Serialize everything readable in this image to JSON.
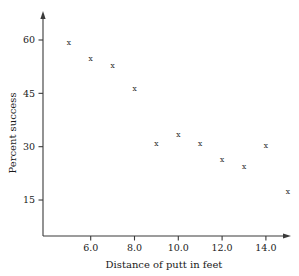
{
  "chart_data": {
    "type": "scatter",
    "title": "",
    "xlabel": "Distance of putt in feet",
    "ylabel": "Percent success",
    "xlim": [
      3.6,
      15.8
    ],
    "ylim": [
      10.5,
      63.5
    ],
    "xticks": [
      "6.0",
      "8.0",
      "10.0",
      "12.0",
      "14.0"
    ],
    "xtick_values": [
      6.0,
      8.0,
      10.0,
      12.0,
      14.0
    ],
    "yticks": [
      "15",
      "30",
      "45",
      "60"
    ],
    "ytick_values": [
      15,
      30,
      45,
      60
    ],
    "grid": false,
    "legend": false,
    "marker": "x",
    "x": [
      5,
      6,
      7,
      8,
      9,
      10,
      11,
      12,
      13,
      14,
      15
    ],
    "y": [
      59.5,
      55.0,
      53.0,
      46.5,
      31.0,
      33.5,
      31.0,
      26.5,
      24.5,
      30.5,
      17.5
    ],
    "points": [
      {
        "x": 5,
        "y": 59.5
      },
      {
        "x": 6,
        "y": 55.0
      },
      {
        "x": 7,
        "y": 53.0
      },
      {
        "x": 8,
        "y": 46.5
      },
      {
        "x": 9,
        "y": 31.0
      },
      {
        "x": 10,
        "y": 33.5
      },
      {
        "x": 11,
        "y": 31.0
      },
      {
        "x": 12,
        "y": 26.5
      },
      {
        "x": 13,
        "y": 24.5
      },
      {
        "x": 14,
        "y": 30.5
      },
      {
        "x": 15,
        "y": 17.5
      }
    ]
  },
  "axes": {
    "x_title": "Distance of putt in feet",
    "y_title": "Percent success",
    "x_tick_labels": [
      "6.0",
      "8.0",
      "10.0",
      "12.0",
      "14.0"
    ],
    "y_tick_labels": [
      "15",
      "30",
      "45",
      "60"
    ],
    "marker_glyph": "x"
  },
  "colors": {
    "axis": "#3a3a3a",
    "text": "#1a1a1a",
    "marker": "#2b2b2b",
    "background": "#ffffff"
  }
}
